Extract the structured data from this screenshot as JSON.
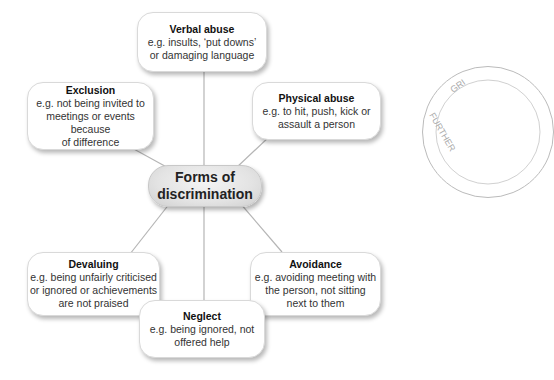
{
  "center": {
    "line1": "Forms of",
    "line2": "discrimination"
  },
  "nodes": [
    {
      "id": "verbal",
      "title": "Verbal abuse",
      "lines": [
        "e.g. insults, ‘put downs’",
        "or damaging language"
      ]
    },
    {
      "id": "exclusion",
      "title": "Exclusion",
      "lines": [
        "e.g. not being invited to",
        "meetings or events because",
        "of difference"
      ]
    },
    {
      "id": "physical",
      "title": "Physical abuse",
      "lines": [
        "e.g. to hit, push, kick or",
        "assault a person"
      ]
    },
    {
      "id": "devaluing",
      "title": "Devaluing",
      "lines": [
        "e.g. being unfairly criticised",
        "or ignored or achievements",
        "are not praised"
      ]
    },
    {
      "id": "avoidance",
      "title": "Avoidance",
      "lines": [
        "e.g. avoiding meeting with",
        "the person, not sitting",
        "next to them"
      ]
    },
    {
      "id": "neglect",
      "title": "Neglect",
      "lines": [
        "e.g. being ignored, not",
        "offered help"
      ]
    }
  ],
  "stamp": {
    "text_top": "GRI",
    "text_side": "FURTHER"
  },
  "colors": {
    "line": "#b5b5b5",
    "box_border": "#d9d9d9",
    "center_fill": "#e3e3e3"
  }
}
